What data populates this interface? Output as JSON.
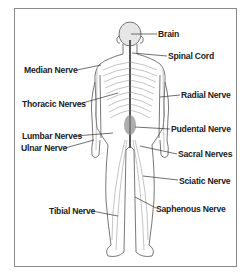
{
  "diagram": {
    "type": "anatomical-illustration",
    "colors": {
      "border": "#8a8a8a",
      "outline": "#555555",
      "nerve": "#7a7a7a",
      "text": "#222222",
      "background": "#ffffff"
    },
    "labels": [
      {
        "id": "brain",
        "text": "Brain",
        "side": "right"
      },
      {
        "id": "spinal-cord",
        "text": "Spinal Cord",
        "side": "right"
      },
      {
        "id": "median-nerve",
        "text": "Median Nerve",
        "side": "left"
      },
      {
        "id": "radial-nerve",
        "text": "Radial Nerve",
        "side": "right"
      },
      {
        "id": "thoracic-nerves",
        "text": "Thoracic Nerves",
        "side": "left"
      },
      {
        "id": "pudental-nerve",
        "text": "Pudental Nerve",
        "side": "right"
      },
      {
        "id": "lumbar-nerves",
        "text": "Lumbar Nerves",
        "side": "left"
      },
      {
        "id": "ulnar-nerve",
        "text": "Ulnar Nerve",
        "side": "left"
      },
      {
        "id": "sacral-nerves",
        "text": "Sacral Nerves",
        "side": "right"
      },
      {
        "id": "sciatic-nerve",
        "text": "Sciatic Nerve",
        "side": "right"
      },
      {
        "id": "tibial-nerve",
        "text": "Tibial Nerve",
        "side": "left"
      },
      {
        "id": "saphenous-nerve",
        "text": "Saphenous  Nerve",
        "side": "right"
      }
    ]
  }
}
